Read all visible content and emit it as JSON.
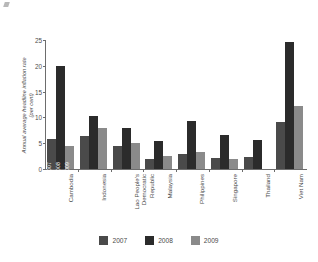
{
  "chart_data": {
    "type": "bar",
    "title": "",
    "subtitle": "",
    "xlabel": "",
    "ylabel": "Annual average headline inflation rate (per cent)",
    "ylabel_line1": "Annual average headline inflation rate",
    "ylabel_line2": "(per cent)",
    "ylim": [
      0,
      25
    ],
    "yticks": [
      0,
      5,
      10,
      15,
      20,
      25
    ],
    "ytick_labels": [
      "0",
      "5",
      "10",
      "15",
      "20",
      "25"
    ],
    "grid": false,
    "legend_position": "bottom",
    "categories": [
      "Cambodia",
      "Indonesia",
      "Lao People's Democratic Republic",
      "Malaysia",
      "Philippines",
      "Singapore",
      "Thailand",
      "Viet Nam"
    ],
    "category_lines": [
      [
        "Cambodia"
      ],
      [
        "Indonesia"
      ],
      [
        "Lao People's",
        "Democratic",
        "Republic"
      ],
      [
        "Malaysia"
      ],
      [
        "Philippines"
      ],
      [
        "Singapore"
      ],
      [
        "Thailand"
      ],
      [
        "Viet Nam"
      ]
    ],
    "series": [
      {
        "name": "2007",
        "color": "#4a4a4a",
        "values": [
          5.9,
          6.4,
          4.5,
          2.0,
          2.9,
          2.1,
          2.3,
          9.1
        ]
      },
      {
        "name": "2008",
        "color": "#2b2b2b",
        "values": [
          20.0,
          10.3,
          8.0,
          5.4,
          9.4,
          6.6,
          5.6,
          24.6
        ]
      },
      {
        "name": "2009",
        "color": "#8a8a8a",
        "values": [
          4.4,
          7.9,
          5.0,
          2.5,
          3.3,
          2.0,
          0.0,
          12.2
        ]
      }
    ],
    "annotations": [
      {
        "category": "Cambodia",
        "series": "2007",
        "text": "2007"
      },
      {
        "category": "Cambodia",
        "series": "2008",
        "text": "2008"
      },
      {
        "category": "Cambodia",
        "series": "2009",
        "text": "2009"
      }
    ]
  },
  "legend": {
    "items": [
      {
        "label": "2007",
        "color": "#4a4a4a"
      },
      {
        "label": "2008",
        "color": "#2b2b2b"
      },
      {
        "label": "2009",
        "color": "#8a8a8a"
      }
    ]
  }
}
